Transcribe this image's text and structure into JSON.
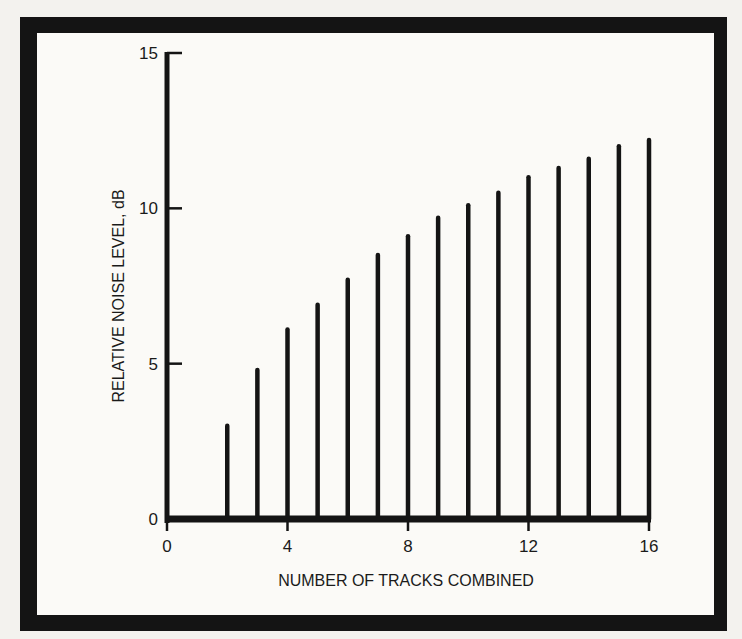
{
  "chart_data": {
    "type": "bar",
    "title": "",
    "xlabel": "NUMBER OF TRACKS COMBINED",
    "ylabel": "RELATIVE NOISE LEVEL, dB",
    "x": [
      2,
      3,
      4,
      5,
      6,
      7,
      8,
      9,
      10,
      11,
      12,
      13,
      14,
      15,
      16
    ],
    "values": [
      3.0,
      4.8,
      6.1,
      6.9,
      7.7,
      8.5,
      9.1,
      9.7,
      10.1,
      10.5,
      11.0,
      11.3,
      11.6,
      12.0,
      12.2
    ],
    "xlim": [
      0,
      16
    ],
    "ylim": [
      0,
      15
    ],
    "x_ticks": [
      0,
      4,
      8,
      12,
      16
    ],
    "x_tick_labels": [
      "0",
      "4",
      "8",
      "12",
      "16"
    ],
    "y_ticks": [
      0,
      5,
      10,
      15
    ],
    "y_tick_labels": [
      "0",
      "5",
      "10",
      "15"
    ],
    "grid": false,
    "legend": null,
    "bar_style": "thin vertical lines (stem plot)",
    "colors": {
      "ink": "#141414",
      "paper": "#fbfaf7"
    }
  },
  "axes": {
    "x_title": "NUMBER OF TRACKS COMBINED",
    "y_title": "RELATIVE NOISE LEVEL, dB"
  }
}
